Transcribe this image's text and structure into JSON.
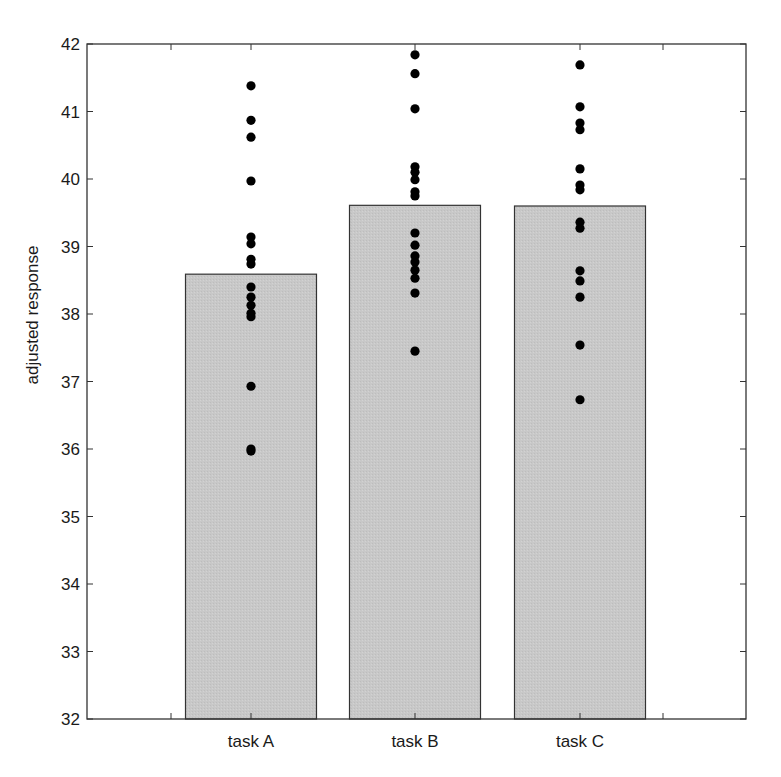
{
  "chart_data": {
    "type": "bar",
    "subtype": "bar with overlaid individual data points (dot strip)",
    "title": "",
    "xlabel": "",
    "ylabel": "adjusted response",
    "categories": [
      "task A",
      "task B",
      "task C"
    ],
    "values": [
      38.59,
      39.61,
      39.6
    ],
    "ylim": [
      32,
      42
    ],
    "yticks": [
      32,
      33,
      34,
      35,
      36,
      37,
      38,
      39,
      40,
      41,
      42
    ],
    "grid": false,
    "legend": null,
    "bar_color": "#c8c8c8",
    "point_color": "#000000",
    "points": [
      {
        "category": "task A",
        "values": [
          41.38,
          40.87,
          40.62,
          39.97,
          39.14,
          39.04,
          38.81,
          38.74,
          38.4,
          38.25,
          38.13,
          38.01,
          37.96,
          36.93,
          36.0,
          35.97
        ]
      },
      {
        "category": "task B",
        "values": [
          41.84,
          41.56,
          41.04,
          40.18,
          40.1,
          39.99,
          39.81,
          39.75,
          39.2,
          39.02,
          38.86,
          38.77,
          38.65,
          38.53,
          38.31,
          37.45
        ]
      },
      {
        "category": "task C",
        "values": [
          41.69,
          41.07,
          40.83,
          40.73,
          40.15,
          39.91,
          39.84,
          39.36,
          39.27,
          38.64,
          38.49,
          38.25,
          37.54,
          36.73
        ]
      }
    ]
  }
}
